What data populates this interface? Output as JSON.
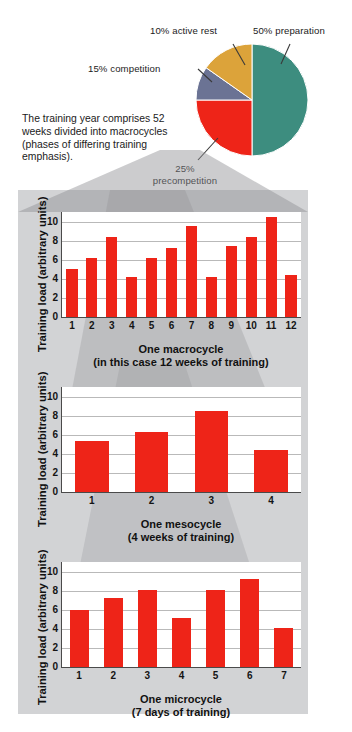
{
  "intro": {
    "text": "The training year comprises 52 weeks divided into macrocycles (phases of differing training emphasis)."
  },
  "pie": {
    "labels": {
      "preparation": "50% preparation",
      "precompetition": "25% precompetition",
      "competition": "15% competition",
      "active_rest": "10% active rest"
    },
    "colors": {
      "preparation": "#3d8d7f",
      "precompetition": "#ee2418",
      "competition": "#6b7394",
      "active_rest": "#dca33a"
    }
  },
  "chart_data": [
    {
      "type": "bar",
      "name": "macrocycle",
      "title": "One macrocycle",
      "subtitle": "(in this case 12 weeks of training)",
      "ylabel": "Training load (arbitrary units)",
      "xlabel": "",
      "categories": [
        "1",
        "2",
        "3",
        "4",
        "5",
        "6",
        "7",
        "8",
        "9",
        "10",
        "11",
        "12"
      ],
      "values": [
        5.0,
        6.2,
        8.4,
        4.2,
        6.2,
        7.2,
        9.5,
        4.2,
        7.4,
        8.4,
        10.5,
        4.4
      ],
      "yticks": [
        "0",
        "2",
        "4",
        "6",
        "8",
        "10"
      ],
      "ylim": [
        0,
        11
      ],
      "grid": true,
      "bar_color": "#ee2418",
      "legend": "none"
    },
    {
      "type": "bar",
      "name": "mesocycle",
      "title": "One mesocycle",
      "subtitle": "(4 weeks of training)",
      "ylabel": "Training load (arbitrary units)",
      "xlabel": "",
      "categories": [
        "1",
        "2",
        "3",
        "4"
      ],
      "values": [
        5.3,
        6.3,
        8.5,
        4.4
      ],
      "yticks": [
        "0",
        "2",
        "4",
        "6",
        "8",
        "10"
      ],
      "ylim": [
        0,
        11
      ],
      "grid": true,
      "bar_color": "#ee2418",
      "legend": "none"
    },
    {
      "type": "bar",
      "name": "microcycle",
      "title": "One microcycle",
      "subtitle": "(7 days of training)",
      "ylabel": "Training load (arbitrary units)",
      "xlabel": "",
      "categories": [
        "1",
        "2",
        "3",
        "4",
        "5",
        "6",
        "7"
      ],
      "values": [
        6.0,
        7.2,
        8.1,
        5.1,
        8.1,
        9.2,
        4.1
      ],
      "yticks": [
        "0",
        "2",
        "4",
        "6",
        "8",
        "10"
      ],
      "ylim": [
        0,
        11
      ],
      "grid": true,
      "bar_color": "#ee2418",
      "legend": "none"
    }
  ]
}
